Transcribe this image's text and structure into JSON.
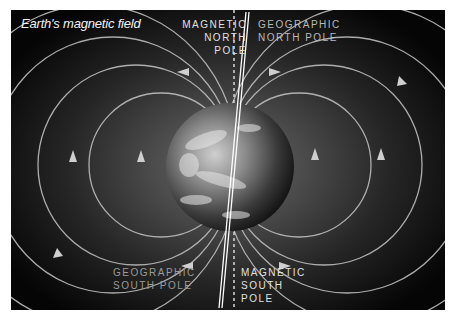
{
  "diagram": {
    "title": "Earth's magnetic field",
    "labels": {
      "magnetic_north": [
        "Magnetic",
        "North",
        "Pole"
      ],
      "geographic_north": [
        "Geographic",
        "North Pole"
      ],
      "geographic_south": [
        "Geographic",
        "South Pole"
      ],
      "magnetic_south": [
        "Magnetic",
        "South",
        "Pole"
      ]
    },
    "elements": {
      "planet": "earth-globe",
      "geographic_axis": "solid-double-line",
      "magnetic_axis": "dashed-line",
      "field_lines": "concentric-loops-with-arrows"
    },
    "colors": {
      "background_center": "#6a6a6a",
      "background_edge": "#050505",
      "field_line": "#c8c8c8",
      "text": "#e0e0e0"
    }
  }
}
